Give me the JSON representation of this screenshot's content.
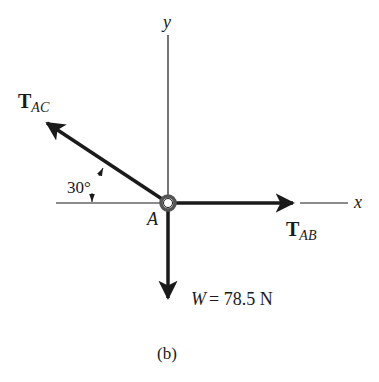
{
  "diagram": {
    "type": "free-body-diagram",
    "caption": "(b)",
    "point": {
      "label": "A"
    },
    "axes": {
      "x": {
        "label": "x"
      },
      "y": {
        "label": "y"
      }
    },
    "forces": [
      {
        "id": "T_AC",
        "symbol": "T",
        "subscript": "AC",
        "direction": "up-left",
        "angle_label": "30°",
        "angle_reference": "negative x-axis"
      },
      {
        "id": "T_AB",
        "symbol": "T",
        "subscript": "AB",
        "direction": "right (+x)"
      },
      {
        "id": "W",
        "symbol": "W",
        "value_label": "= 78.5 N",
        "direction": "down (-y)"
      }
    ],
    "colors": {
      "ink": "#1a1a1a",
      "background": "#ffffff",
      "ring": "#555555"
    }
  }
}
